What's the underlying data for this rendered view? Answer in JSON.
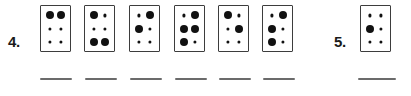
{
  "worksheet": {
    "title": "Braille cell identification exercise",
    "background_color": "#ffffff",
    "ink_color": "#111111",
    "cell_border_color": "#3d3d3d",
    "blank_line_color": "#6b6b6b"
  },
  "exercises": [
    {
      "number_label": "4.",
      "number_x": 8,
      "number_y": 34,
      "cells": [
        {
          "name": "braille-cell-4-1",
          "x": 40,
          "y": 5,
          "dots": [
            {
              "row": 1,
              "col": "left",
              "size": "large"
            },
            {
              "row": 1,
              "col": "right",
              "size": "large"
            },
            {
              "row": 2,
              "col": "left",
              "size": "small"
            },
            {
              "row": 2,
              "col": "right",
              "size": "small"
            },
            {
              "row": 3,
              "col": "left",
              "size": "small"
            },
            {
              "row": 3,
              "col": "right",
              "size": "small"
            }
          ]
        },
        {
          "name": "braille-cell-4-2",
          "x": 84,
          "y": 5,
          "dots": [
            {
              "row": 1,
              "col": "left",
              "size": "large"
            },
            {
              "row": 1,
              "col": "right",
              "size": "small"
            },
            {
              "row": 2,
              "col": "left",
              "size": "small"
            },
            {
              "row": 2,
              "col": "right",
              "size": "small"
            },
            {
              "row": 3,
              "col": "left",
              "size": "large"
            },
            {
              "row": 3,
              "col": "right",
              "size": "large"
            }
          ]
        },
        {
          "name": "braille-cell-4-3",
          "x": 129,
          "y": 5,
          "dots": [
            {
              "row": 1,
              "col": "left",
              "size": "small"
            },
            {
              "row": 1,
              "col": "right",
              "size": "large"
            },
            {
              "row": 2,
              "col": "left",
              "size": "large"
            },
            {
              "row": 2,
              "col": "right",
              "size": "small"
            },
            {
              "row": 3,
              "col": "left",
              "size": "small"
            },
            {
              "row": 3,
              "col": "right",
              "size": "small"
            }
          ]
        },
        {
          "name": "braille-cell-4-4",
          "x": 174,
          "y": 5,
          "dots": [
            {
              "row": 1,
              "col": "left",
              "size": "small"
            },
            {
              "row": 1,
              "col": "right",
              "size": "large"
            },
            {
              "row": 2,
              "col": "left",
              "size": "large"
            },
            {
              "row": 2,
              "col": "right",
              "size": "large"
            },
            {
              "row": 3,
              "col": "left",
              "size": "large"
            },
            {
              "row": 3,
              "col": "right",
              "size": "small"
            }
          ]
        },
        {
          "name": "braille-cell-4-5",
          "x": 218,
          "y": 5,
          "dots": [
            {
              "row": 1,
              "col": "left",
              "size": "large"
            },
            {
              "row": 1,
              "col": "right",
              "size": "small"
            },
            {
              "row": 2,
              "col": "left",
              "size": "small"
            },
            {
              "row": 2,
              "col": "right",
              "size": "large"
            },
            {
              "row": 3,
              "col": "left",
              "size": "small"
            },
            {
              "row": 3,
              "col": "right",
              "size": "small"
            }
          ]
        },
        {
          "name": "braille-cell-4-6",
          "x": 262,
          "y": 5,
          "dots": [
            {
              "row": 1,
              "col": "left",
              "size": "small"
            },
            {
              "row": 1,
              "col": "right",
              "size": "large"
            },
            {
              "row": 2,
              "col": "left",
              "size": "large"
            },
            {
              "row": 2,
              "col": "right",
              "size": "small"
            },
            {
              "row": 3,
              "col": "left",
              "size": "large"
            },
            {
              "row": 3,
              "col": "right",
              "size": "small"
            }
          ]
        }
      ],
      "blanks": [
        {
          "name": "answer-blank-4-1",
          "x": 40,
          "y": 78,
          "width": 32
        },
        {
          "name": "answer-blank-4-2",
          "x": 85,
          "y": 78,
          "width": 32
        },
        {
          "name": "answer-blank-4-3",
          "x": 130,
          "y": 78,
          "width": 32
        },
        {
          "name": "answer-blank-4-4",
          "x": 175,
          "y": 78,
          "width": 32
        },
        {
          "name": "answer-blank-4-5",
          "x": 219,
          "y": 78,
          "width": 32
        },
        {
          "name": "answer-blank-4-6",
          "x": 263,
          "y": 78,
          "width": 32
        }
      ]
    },
    {
      "number_label": "5.",
      "number_x": 334,
      "number_y": 34,
      "cells": [
        {
          "name": "braille-cell-5-1",
          "x": 360,
          "y": 5,
          "dots": [
            {
              "row": 1,
              "col": "left",
              "size": "small"
            },
            {
              "row": 1,
              "col": "right",
              "size": "small"
            },
            {
              "row": 2,
              "col": "left",
              "size": "large"
            },
            {
              "row": 2,
              "col": "right",
              "size": "small"
            },
            {
              "row": 3,
              "col": "left",
              "size": "small"
            },
            {
              "row": 3,
              "col": "right",
              "size": "small"
            }
          ]
        }
      ],
      "blanks": [
        {
          "name": "answer-blank-5-1",
          "x": 358,
          "y": 78,
          "width": 38
        }
      ]
    }
  ]
}
